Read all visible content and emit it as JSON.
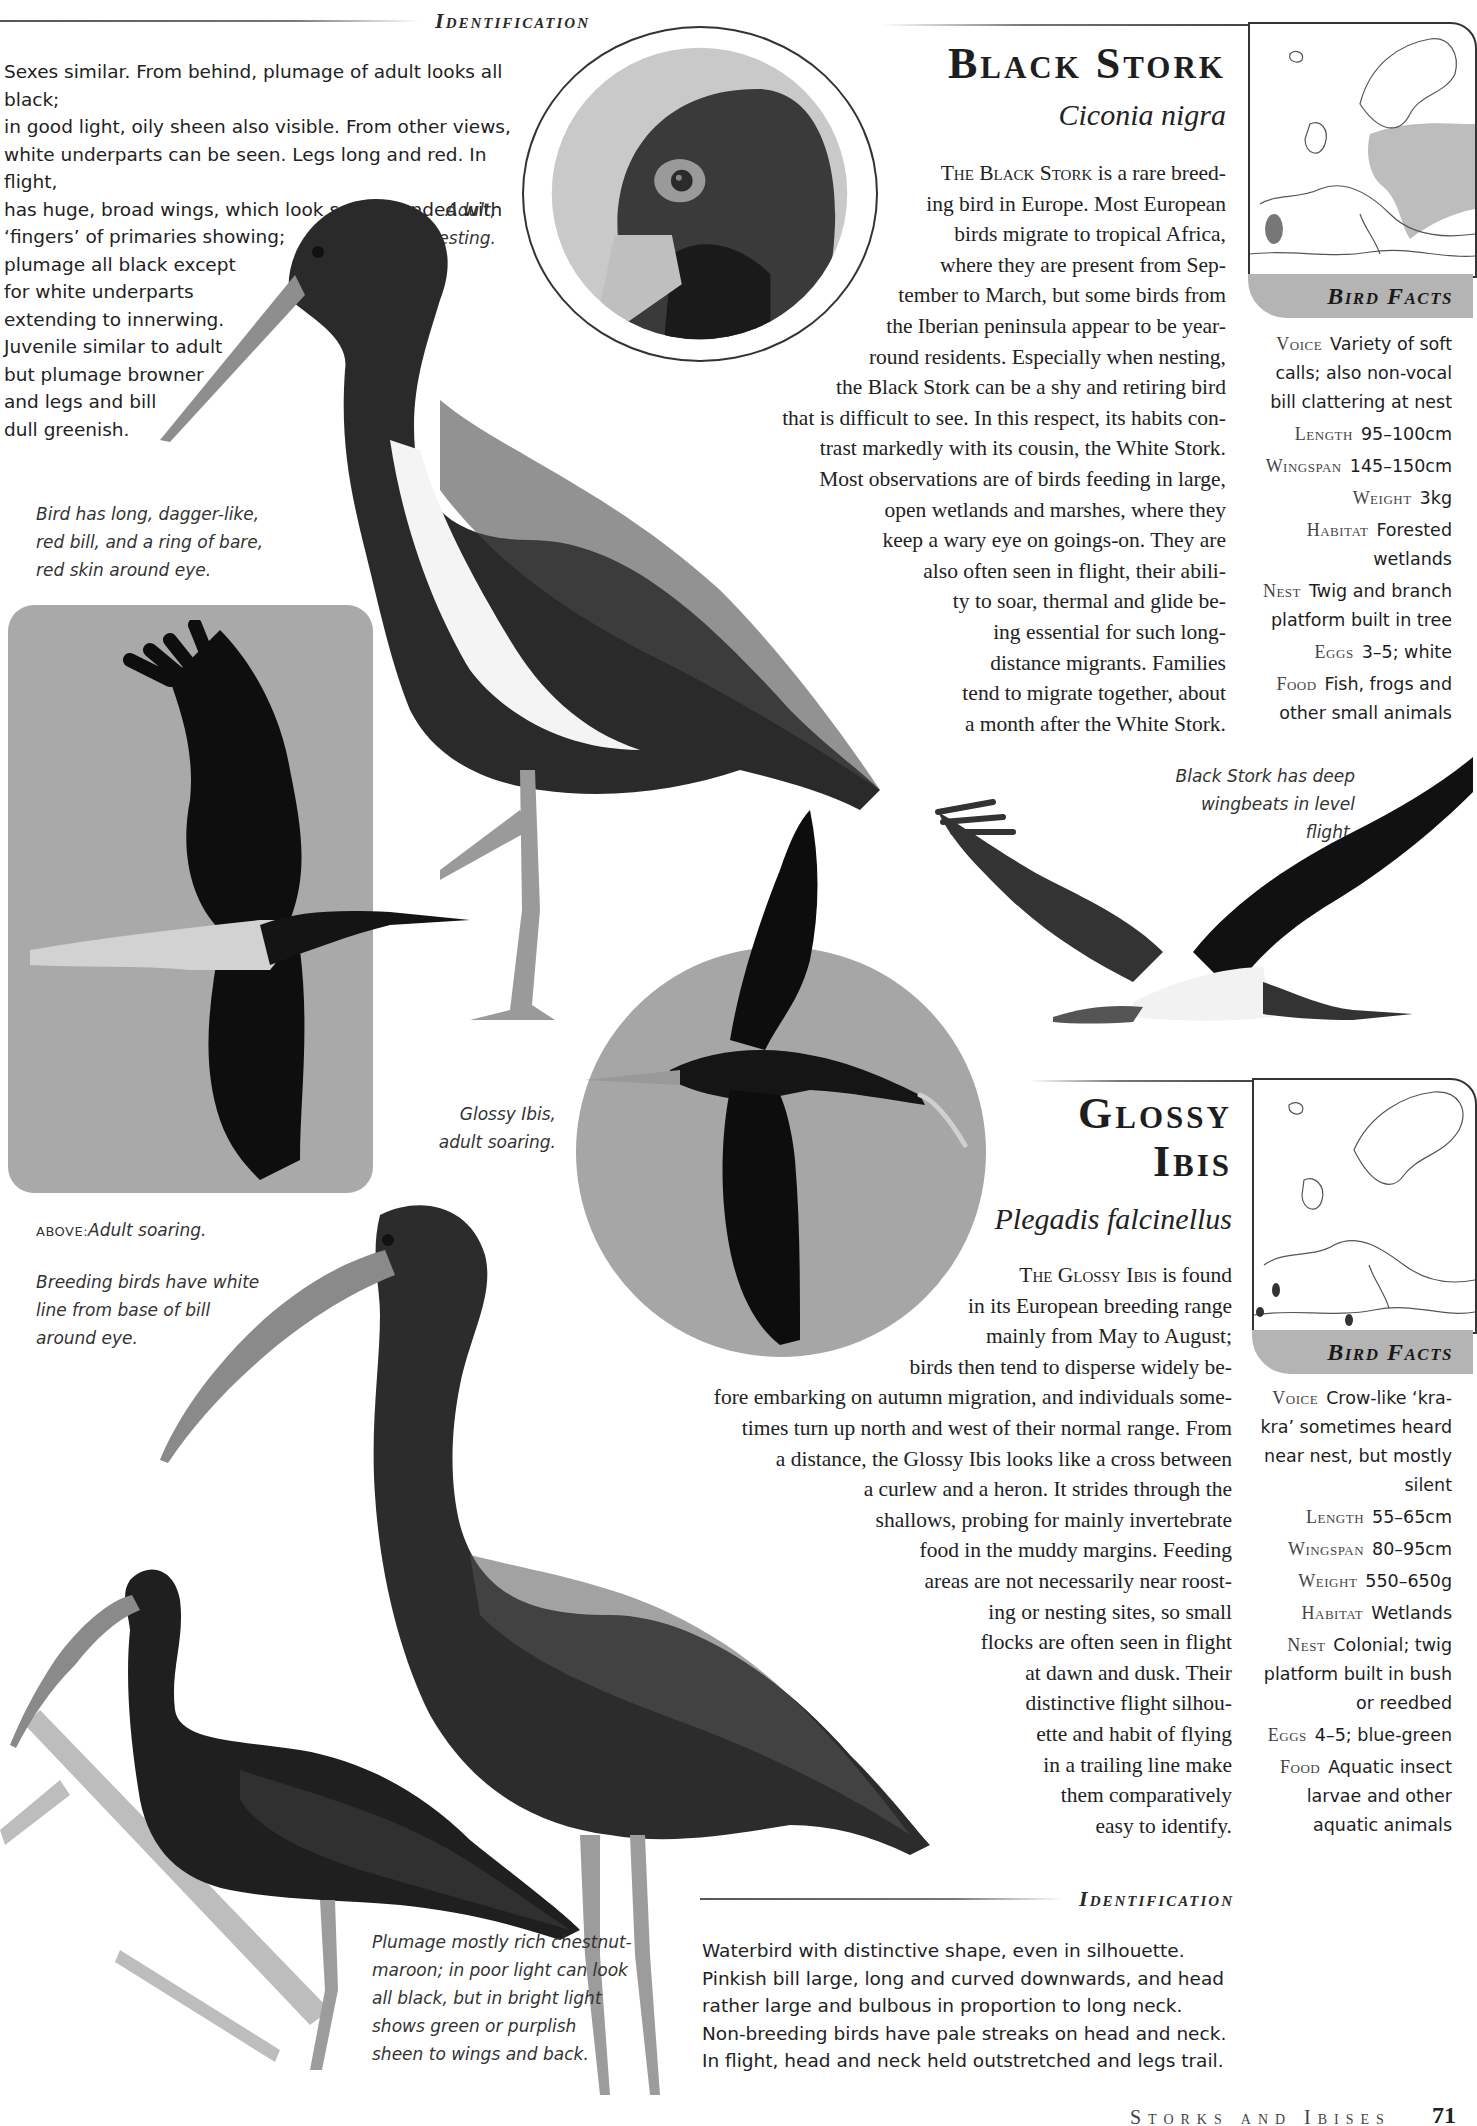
{
  "black_stork": {
    "identification": {
      "heading": "Identification",
      "lines": [
        "Sexes similar. From behind, plumage of adult looks all black;",
        "in good light, oily sheen also visible. From other views,",
        "white underparts can be seen. Legs long and red. In flight,",
        "has huge, broad wings, which look square-ended with",
        "‘fingers’ of primaries showing;",
        "plumage all black except",
        "for white underparts",
        "extending to innerwing.",
        "Juvenile similar to adult",
        "but plumage browner",
        "and legs and bill",
        "dull greenish."
      ]
    },
    "title": "Black Stork",
    "latin": "Ciconia nigra",
    "prose": {
      "lead": "The Black Stork",
      "lines": [
        " is a rare breed-",
        "ing bird in Europe. Most European",
        "birds migrate to tropical Africa,",
        "where they are present from Sep-",
        "tember to March, but some birds from",
        "the Iberian peninsula appear to be year-",
        "round residents. Especially when nesting,",
        "the Black Stork can be a shy and retiring bird",
        "that is difficult to see. In this respect, its habits con-",
        "trast markedly with its cousin, the White Stork.",
        "Most observations are of birds feeding in large,",
        "open wetlands and marshes, where they",
        "keep a wary eye on goings-on. They are",
        "also often seen in flight, their abili-",
        "ty to soar, thermal and glide be-",
        "ing essential for such long-",
        "distance migrants. Families",
        "tend to migrate together, about",
        "a month after the White Stork."
      ]
    },
    "bird_facts_label": "Bird Facts",
    "facts": [
      {
        "key": "Voice",
        "value": "Variety of soft calls; also non-vocal bill clattering at nest"
      },
      {
        "key": "Length",
        "value": "95–100cm"
      },
      {
        "key": "Wingspan",
        "value": "145–150cm"
      },
      {
        "key": "Weight",
        "value": "3kg"
      },
      {
        "key": "Habitat",
        "value": "Forested wetlands"
      },
      {
        "key": "Nest",
        "value": "Twig and branch platform built in tree"
      },
      {
        "key": "Eggs",
        "value": "3–5; white"
      },
      {
        "key": "Food",
        "value": "Fish, frogs and other small animals"
      }
    ],
    "captions": {
      "adult_resting": [
        "Adult,",
        "resting."
      ],
      "bill": [
        "Bird has long, dagger-like,",
        "red bill, and a ring of bare,",
        "red skin around eye."
      ],
      "above_prefix": "ABOVE:",
      "above_text": "Adult soaring.",
      "flight": [
        "Black Stork has deep",
        "wingbeats in level flight."
      ]
    }
  },
  "glossy_ibis": {
    "title_line1": "Glossy",
    "title_line2": "Ibis",
    "latin": "Plegadis falcinellus",
    "prose": {
      "lead": "The Glossy Ibis",
      "lines": [
        " is found",
        "in its European breeding range",
        "mainly from May to August;",
        "birds then tend to disperse widely be-",
        "fore embarking on autumn migration, and individuals some-",
        "times turn up north and west of their normal range. From",
        "a distance, the Glossy Ibis looks like a cross between",
        "a curlew and a heron. It strides through the",
        "shallows, probing for mainly invertebrate",
        "food in the muddy margins. Feeding",
        "areas are not necessarily near roost-",
        "ing or nesting sites, so small",
        "flocks are often seen in flight",
        "at dawn and dusk. Their",
        "distinctive flight silhou-",
        "ette and habit of flying",
        "in a trailing line make",
        "them comparatively",
        "easy to identify."
      ]
    },
    "bird_facts_label": "Bird Facts",
    "facts": [
      {
        "key": "Voice",
        "value": "Crow-like ‘kra-kra’ sometimes heard near nest, but mostly silent"
      },
      {
        "key": "Length",
        "value": "55–65cm"
      },
      {
        "key": "Wingspan",
        "value": "80–95cm"
      },
      {
        "key": "Weight",
        "value": "550–650g"
      },
      {
        "key": "Habitat",
        "value": "Wetlands"
      },
      {
        "key": "Nest",
        "value": "Colonial; twig platform built in bush or reedbed"
      },
      {
        "key": "Eggs",
        "value": "4–5; blue-green"
      },
      {
        "key": "Food",
        "value": "Aquatic insect larvae and other aquatic animals"
      }
    ],
    "captions": {
      "soaring": [
        "Glossy Ibis,",
        "adult soaring."
      ],
      "breeding": [
        "Breeding birds have white",
        "line from base of bill",
        "around eye."
      ],
      "plumage": [
        "Plumage mostly rich chestnut-",
        "maroon; in poor light can look",
        "all black, but in bright light",
        "shows green or purplish",
        "sheen to wings and back."
      ]
    },
    "identification": {
      "heading": "Identification",
      "lines": [
        "Waterbird with distinctive shape, even in silhouette.",
        "Pinkish bill large, long and curved downwards, and head",
        "rather large and bulbous in proportion to long neck.",
        "Non-breeding birds have pale streaks on head and neck.",
        "In flight, head and neck held outstretched and legs trail."
      ]
    }
  },
  "footer": {
    "section": "Storks and Ibises",
    "page_number": "71"
  },
  "colors": {
    "panel_gray": "#a9a9a9",
    "tab_gray": "#b4b4b4",
    "range_gray": "#bdbdbd",
    "ink": "#1d1d1d"
  }
}
